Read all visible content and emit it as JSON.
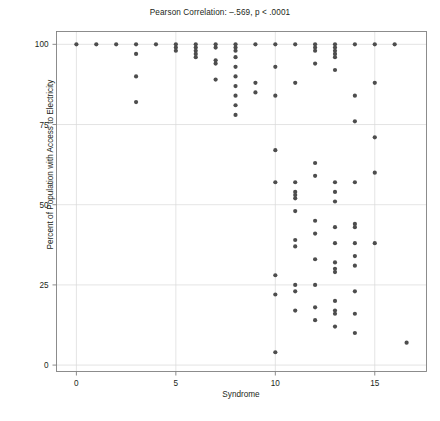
{
  "chart_data": {
    "type": "scatter",
    "title": "Pearson Correlation: –.569, p < .0001",
    "xlabel": "Syndrome",
    "ylabel": "Percent of Population with Access to Electricity",
    "xlim": [
      -1,
      17.6
    ],
    "ylim": [
      -2,
      104
    ],
    "xticks": [
      0,
      5,
      10,
      15
    ],
    "xtick_labels": [
      "0",
      "5",
      "10",
      "15"
    ],
    "yticks": [
      0,
      25,
      50,
      75,
      100
    ],
    "ytick_labels": [
      "0",
      "25",
      "50",
      "75",
      "100"
    ],
    "grid": true,
    "legend": "none",
    "marker_color": "#4d4d4d",
    "grid_color": "#d9d9d9",
    "axis_color": "#808080",
    "points": [
      [
        0,
        100
      ],
      [
        1,
        100
      ],
      [
        2,
        100
      ],
      [
        3,
        100
      ],
      [
        3,
        97
      ],
      [
        3,
        90
      ],
      [
        3,
        82
      ],
      [
        4,
        100
      ],
      [
        5,
        100
      ],
      [
        5,
        99
      ],
      [
        5,
        98
      ],
      [
        6,
        100
      ],
      [
        6,
        99
      ],
      [
        6,
        98
      ],
      [
        6,
        97
      ],
      [
        6,
        96
      ],
      [
        7,
        100
      ],
      [
        7,
        99
      ],
      [
        7,
        95
      ],
      [
        7,
        94
      ],
      [
        7,
        89
      ],
      [
        8,
        100
      ],
      [
        8,
        99
      ],
      [
        8,
        98
      ],
      [
        8,
        96
      ],
      [
        8,
        93
      ],
      [
        8,
        90
      ],
      [
        8,
        87
      ],
      [
        8,
        84
      ],
      [
        8,
        81
      ],
      [
        8,
        78
      ],
      [
        9,
        100
      ],
      [
        9,
        88
      ],
      [
        9,
        85
      ],
      [
        10,
        100
      ],
      [
        10,
        93
      ],
      [
        10,
        84
      ],
      [
        10,
        67
      ],
      [
        10,
        57
      ],
      [
        10,
        28
      ],
      [
        10,
        22
      ],
      [
        10,
        4
      ],
      [
        11,
        100
      ],
      [
        11,
        88
      ],
      [
        11,
        57
      ],
      [
        11,
        54
      ],
      [
        11,
        53
      ],
      [
        11,
        52
      ],
      [
        11,
        48
      ],
      [
        11,
        39
      ],
      [
        11,
        37
      ],
      [
        11,
        25
      ],
      [
        11,
        23
      ],
      [
        11,
        17
      ],
      [
        12,
        100
      ],
      [
        12,
        99
      ],
      [
        12,
        98
      ],
      [
        12,
        94
      ],
      [
        12,
        63
      ],
      [
        12,
        59
      ],
      [
        12,
        45
      ],
      [
        12,
        41
      ],
      [
        12,
        33
      ],
      [
        12,
        25
      ],
      [
        12,
        18
      ],
      [
        12,
        14
      ],
      [
        13,
        100
      ],
      [
        13,
        99
      ],
      [
        13,
        98
      ],
      [
        13,
        97
      ],
      [
        13,
        96
      ],
      [
        13,
        92
      ],
      [
        13,
        57
      ],
      [
        13,
        54
      ],
      [
        13,
        51
      ],
      [
        13,
        43
      ],
      [
        13,
        38
      ],
      [
        13,
        32
      ],
      [
        13,
        30
      ],
      [
        13,
        29
      ],
      [
        13,
        20
      ],
      [
        13,
        17
      ],
      [
        13,
        16
      ],
      [
        13,
        12
      ],
      [
        14,
        100
      ],
      [
        14,
        84
      ],
      [
        14,
        76
      ],
      [
        14,
        57
      ],
      [
        14,
        44
      ],
      [
        14,
        43
      ],
      [
        14,
        38
      ],
      [
        14,
        34
      ],
      [
        14,
        31
      ],
      [
        14,
        23
      ],
      [
        14,
        16
      ],
      [
        14,
        10
      ],
      [
        15,
        100
      ],
      [
        15,
        88
      ],
      [
        15,
        71
      ],
      [
        15,
        60
      ],
      [
        15,
        38
      ],
      [
        16,
        100
      ],
      [
        16.6,
        7
      ]
    ]
  }
}
